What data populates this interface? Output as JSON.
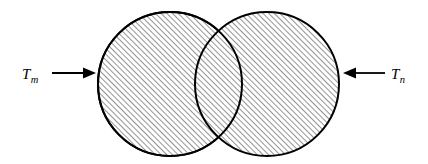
{
  "figure": {
    "background_color": "#ffffff",
    "stroke_color": "#000000",
    "hatch_color": "#3a3a3a",
    "width": 428,
    "height": 164
  },
  "shapes": {
    "left_circle": {
      "name": "left-circle",
      "cx": 170,
      "cy": 84,
      "r": 72,
      "fill": "hatch-45",
      "stroke_width": 2
    },
    "right_circle": {
      "name": "right-circle",
      "cx": 267,
      "cy": 84,
      "r": 72,
      "fill": "hatch-45",
      "stroke_width": 2
    },
    "overlap_region": {
      "name": "overlap-lens",
      "top_intersection_x": 222,
      "top_intersection_y": 22,
      "bottom_intersection_x": 222,
      "bottom_intersection_y": 143
    }
  },
  "annotations": {
    "left": {
      "symbol": "T",
      "subscript": "m",
      "label_x": 22,
      "label_y": 79,
      "arrow": {
        "name": "arrow-right",
        "direction": "right",
        "x1": 52,
        "x2": 96,
        "y": 73,
        "head_length": 12,
        "head_half_width": 5.5
      }
    },
    "right": {
      "symbol": "T",
      "subscript": "n",
      "label_x": 391,
      "label_y": 79,
      "arrow": {
        "name": "arrow-left",
        "direction": "left",
        "x1": 385,
        "x2": 343,
        "y": 73,
        "head_length": 12,
        "head_half_width": 5.5
      }
    }
  },
  "hatch": {
    "angle_degrees": 45,
    "spacing_px": 4,
    "line_width_px": 1.1,
    "direction": "lower-left to upper-right"
  }
}
